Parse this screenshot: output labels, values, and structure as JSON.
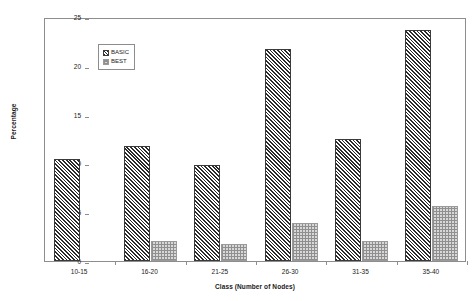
{
  "chart_data": {
    "type": "bar",
    "title": "",
    "subtitle": "",
    "xlabel": "Class (Number of Nodes)",
    "ylabel": "Percentage",
    "categories": [
      "10-15",
      "16-20",
      "21-25",
      "26-30",
      "31-35",
      "35-40"
    ],
    "series": [
      {
        "name": "BASIC",
        "values": [
          10.5,
          11.8,
          9.8,
          21.7,
          12.5,
          23.7
        ]
      },
      {
        "name": "BEST",
        "values": [
          0,
          2.0,
          1.7,
          3.9,
          2.0,
          5.6
        ]
      }
    ],
    "ylim": [
      0,
      25
    ],
    "yticks": [
      0,
      5,
      10,
      15,
      20,
      25
    ],
    "ytick_labels": [
      "0",
      "5",
      "10",
      "15",
      "20",
      "25"
    ],
    "grid": false,
    "legend_position": "upper-left",
    "legend_entries": [
      "BASIC",
      "BEST"
    ],
    "colors": {
      "basic_fill": "#5a5a5a",
      "basic_hatch": "#2b2b2b",
      "best_fill": "#d8d8d8",
      "best_hatch": "#8f8f8f",
      "axis": "#8d8d8d",
      "text": "#1a1a1a",
      "background": "#ffffff"
    }
  }
}
